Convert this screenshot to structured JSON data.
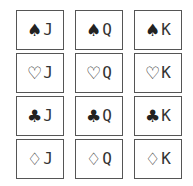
{
  "cards": [
    {
      "suit": "♠",
      "suit_name": "spade",
      "rank": "J"
    },
    {
      "suit": "♠",
      "suit_name": "spade",
      "rank": "Q"
    },
    {
      "suit": "♠",
      "suit_name": "spade",
      "rank": "K"
    },
    {
      "suit": "♡",
      "suit_name": "heart",
      "rank": "J"
    },
    {
      "suit": "♡",
      "suit_name": "heart",
      "rank": "Q"
    },
    {
      "suit": "♡",
      "suit_name": "heart",
      "rank": "K"
    },
    {
      "suit": "♣",
      "suit_name": "club",
      "rank": "J"
    },
    {
      "suit": "♣",
      "suit_name": "club",
      "rank": "Q"
    },
    {
      "suit": "♣",
      "suit_name": "club",
      "rank": "K"
    },
    {
      "suit": "♢",
      "suit_name": "diamond",
      "rank": "J"
    },
    {
      "suit": "♢",
      "suit_name": "diamond",
      "rank": "Q"
    },
    {
      "suit": "♢",
      "suit_name": "diamond",
      "rank": "K"
    }
  ]
}
